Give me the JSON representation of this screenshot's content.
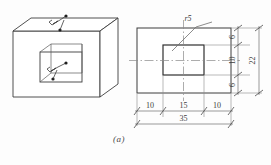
{
  "figure": {
    "caption": "(a)",
    "type": "engineering-drawing"
  },
  "pictorial": {
    "name": "isometric-view",
    "feature_callouts": [
      {
        "id": "top-edge-callout",
        "symbol": "fillet-arrow"
      },
      {
        "id": "inner-pocket-callout",
        "symbol": "fillet-arrow"
      }
    ]
  },
  "orthographic": {
    "name": "front-view",
    "leader_label": "r5",
    "centerlines": [
      "horizontal",
      "vertical"
    ]
  },
  "dimensions": {
    "horizontal": {
      "chain": [
        "10",
        "15",
        "10"
      ],
      "overall": "35"
    },
    "vertical": {
      "chain": [
        "6",
        "10",
        "6"
      ],
      "overall": "22"
    }
  },
  "style": {
    "line_color": "#3d3d3d",
    "thin_line_color": "#6e6e6e",
    "center_line_color": "#8a8a8a",
    "background": "#fdfdfd"
  }
}
